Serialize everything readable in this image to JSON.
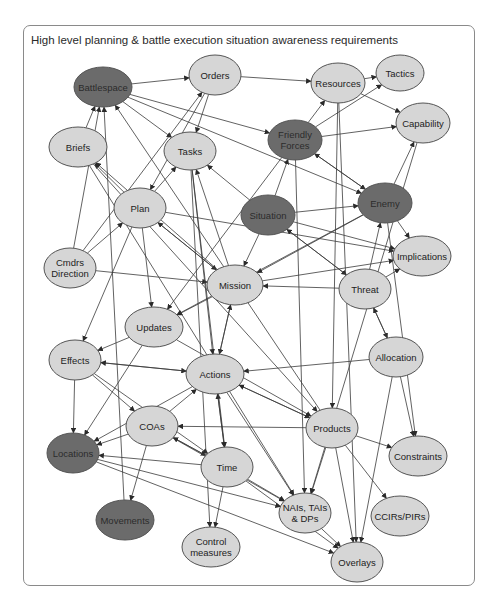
{
  "title": "High level planning & battle execution situation awareness requirements",
  "colors": {
    "light_node": "#d6d6d6",
    "dark_node": "#6b6b6b",
    "stroke": "#555555",
    "edge": "#3a3a3a"
  },
  "nodes": [
    {
      "id": "battlespace",
      "label": [
        "Battlespace"
      ],
      "x": 103,
      "y": 87,
      "rx": 29,
      "ry": 20,
      "dark": true
    },
    {
      "id": "orders",
      "label": [
        "Orders"
      ],
      "x": 215,
      "y": 75,
      "rx": 26,
      "ry": 20,
      "dark": false
    },
    {
      "id": "resources",
      "label": [
        "Resources"
      ],
      "x": 338,
      "y": 83,
      "rx": 27,
      "ry": 20,
      "dark": false
    },
    {
      "id": "tactics",
      "label": [
        "Tactics"
      ],
      "x": 400,
      "y": 73,
      "rx": 24,
      "ry": 18,
      "dark": false
    },
    {
      "id": "capability",
      "label": [
        "Capability"
      ],
      "x": 423,
      "y": 123,
      "rx": 27,
      "ry": 20,
      "dark": false
    },
    {
      "id": "briefs",
      "label": [
        "Briefs"
      ],
      "x": 78,
      "y": 147,
      "rx": 29,
      "ry": 20,
      "dark": false
    },
    {
      "id": "tasks",
      "label": [
        "Tasks"
      ],
      "x": 190,
      "y": 151,
      "rx": 26,
      "ry": 19,
      "dark": false
    },
    {
      "id": "friendly-forces",
      "label": [
        "Friendly",
        "Forces"
      ],
      "x": 295,
      "y": 140,
      "rx": 27,
      "ry": 20,
      "dark": true
    },
    {
      "id": "enemy",
      "label": [
        "Enemy"
      ],
      "x": 385,
      "y": 203,
      "rx": 27,
      "ry": 20,
      "dark": true
    },
    {
      "id": "situation",
      "label": [
        "Situation"
      ],
      "x": 268,
      "y": 215,
      "rx": 27,
      "ry": 20,
      "dark": true
    },
    {
      "id": "plan",
      "label": [
        "Plan"
      ],
      "x": 140,
      "y": 208,
      "rx": 26,
      "ry": 20,
      "dark": false
    },
    {
      "id": "cmdrs-direction",
      "label": [
        "Cmdrs",
        "Direction"
      ],
      "x": 70,
      "y": 268,
      "rx": 26,
      "ry": 20,
      "dark": false
    },
    {
      "id": "implications",
      "label": [
        "Implications"
      ],
      "x": 422,
      "y": 256,
      "rx": 29,
      "ry": 20,
      "dark": false
    },
    {
      "id": "mission",
      "label": [
        "Mission"
      ],
      "x": 235,
      "y": 285,
      "rx": 28,
      "ry": 20,
      "dark": false
    },
    {
      "id": "threat",
      "label": [
        "Threat"
      ],
      "x": 365,
      "y": 289,
      "rx": 26,
      "ry": 20,
      "dark": false
    },
    {
      "id": "updates",
      "label": [
        "Updates"
      ],
      "x": 154,
      "y": 327,
      "rx": 29,
      "ry": 20,
      "dark": false
    },
    {
      "id": "allocation",
      "label": [
        "Allocation"
      ],
      "x": 396,
      "y": 357,
      "rx": 27,
      "ry": 20,
      "dark": false
    },
    {
      "id": "effects",
      "label": [
        "Effects"
      ],
      "x": 75,
      "y": 360,
      "rx": 26,
      "ry": 20,
      "dark": false
    },
    {
      "id": "actions",
      "label": [
        "Actions"
      ],
      "x": 215,
      "y": 374,
      "rx": 29,
      "ry": 20,
      "dark": false
    },
    {
      "id": "coas",
      "label": [
        "COAs"
      ],
      "x": 152,
      "y": 426,
      "rx": 26,
      "ry": 20,
      "dark": false
    },
    {
      "id": "products",
      "label": [
        "Products"
      ],
      "x": 332,
      "y": 428,
      "rx": 26,
      "ry": 20,
      "dark": false
    },
    {
      "id": "constraints",
      "label": [
        "Constraints"
      ],
      "x": 418,
      "y": 456,
      "rx": 29,
      "ry": 20,
      "dark": false
    },
    {
      "id": "locations",
      "label": [
        "Locations"
      ],
      "x": 73,
      "y": 453,
      "rx": 26,
      "ry": 20,
      "dark": true
    },
    {
      "id": "time",
      "label": [
        "Time"
      ],
      "x": 227,
      "y": 467,
      "rx": 26,
      "ry": 20,
      "dark": false
    },
    {
      "id": "nais",
      "label": [
        "NAIs, TAIs",
        "& DPs"
      ],
      "x": 305,
      "y": 513,
      "rx": 26,
      "ry": 20,
      "dark": false
    },
    {
      "id": "ccirs",
      "label": [
        "CCIRs/PIRs"
      ],
      "x": 400,
      "y": 516,
      "rx": 29,
      "ry": 20,
      "dark": false
    },
    {
      "id": "movements",
      "label": [
        "Movements"
      ],
      "x": 125,
      "y": 520,
      "rx": 29,
      "ry": 20,
      "dark": true
    },
    {
      "id": "control-measures",
      "label": [
        "Control",
        "measures"
      ],
      "x": 211,
      "y": 547,
      "rx": 29,
      "ry": 20,
      "dark": false
    },
    {
      "id": "overlays",
      "label": [
        "Overlays"
      ],
      "x": 357,
      "y": 562,
      "rx": 26,
      "ry": 20,
      "dark": false
    }
  ],
  "edges": [
    [
      "battlespace",
      "friendly-forces"
    ],
    [
      "battlespace",
      "tasks"
    ],
    [
      "battlespace",
      "enemy"
    ],
    [
      "battlespace",
      "orders"
    ],
    [
      "orders",
      "resources"
    ],
    [
      "orders",
      "tasks"
    ],
    [
      "orders",
      "plan"
    ],
    [
      "resources",
      "tactics"
    ],
    [
      "resources",
      "capability"
    ],
    [
      "friendly-forces",
      "resources"
    ],
    [
      "friendly-forces",
      "tactics"
    ],
    [
      "friendly-forces",
      "capability"
    ],
    [
      "friendly-forces",
      "enemy"
    ],
    [
      "enemy",
      "friendly-forces"
    ],
    [
      "enemy",
      "capability"
    ],
    [
      "enemy",
      "implications"
    ],
    [
      "enemy",
      "mission"
    ],
    [
      "enemy",
      "updates"
    ],
    [
      "situation",
      "friendly-forces"
    ],
    [
      "situation",
      "enemy"
    ],
    [
      "situation",
      "implications"
    ],
    [
      "situation",
      "mission"
    ],
    [
      "situation",
      "threat"
    ],
    [
      "situation",
      "tasks"
    ],
    [
      "plan",
      "briefs"
    ],
    [
      "plan",
      "tasks"
    ],
    [
      "plan",
      "mission"
    ],
    [
      "plan",
      "updates"
    ],
    [
      "plan",
      "effects"
    ],
    [
      "plan",
      "implications"
    ],
    [
      "cmdrs-direction",
      "battlespace"
    ],
    [
      "cmdrs-direction",
      "plan"
    ],
    [
      "cmdrs-direction",
      "mission"
    ],
    [
      "cmdrs-direction",
      "orders"
    ],
    [
      "mission",
      "plan"
    ],
    [
      "mission",
      "briefs"
    ],
    [
      "mission",
      "tasks"
    ],
    [
      "mission",
      "updates"
    ],
    [
      "mission",
      "implications"
    ],
    [
      "mission",
      "actions"
    ],
    [
      "threat",
      "mission"
    ],
    [
      "threat",
      "allocation"
    ],
    [
      "threat",
      "implications"
    ],
    [
      "threat",
      "enemy"
    ],
    [
      "threat",
      "situation"
    ],
    [
      "updates",
      "effects"
    ],
    [
      "updates",
      "locations"
    ],
    [
      "updates",
      "products"
    ],
    [
      "allocation",
      "actions"
    ],
    [
      "allocation",
      "threat"
    ],
    [
      "allocation",
      "constraints"
    ],
    [
      "allocation",
      "overlays"
    ],
    [
      "effects",
      "actions"
    ],
    [
      "effects",
      "coas"
    ],
    [
      "effects",
      "locations"
    ],
    [
      "effects",
      "time"
    ],
    [
      "actions",
      "effects"
    ],
    [
      "actions",
      "time"
    ],
    [
      "actions",
      "mission"
    ],
    [
      "actions",
      "products"
    ],
    [
      "actions",
      "nais"
    ],
    [
      "actions",
      "locations"
    ],
    [
      "coas",
      "locations"
    ],
    [
      "coas",
      "movements"
    ],
    [
      "coas",
      "time"
    ],
    [
      "coas",
      "nais"
    ],
    [
      "coas",
      "actions"
    ],
    [
      "products",
      "actions"
    ],
    [
      "products",
      "coas"
    ],
    [
      "products",
      "constraints"
    ],
    [
      "products",
      "ccirs"
    ],
    [
      "products",
      "overlays"
    ],
    [
      "products",
      "nais"
    ],
    [
      "products",
      "battlespace"
    ],
    [
      "time",
      "locations"
    ],
    [
      "time",
      "control-measures"
    ],
    [
      "time",
      "nais"
    ],
    [
      "time",
      "overlays"
    ],
    [
      "time",
      "actions"
    ],
    [
      "time",
      "coas"
    ],
    [
      "locations",
      "overlays"
    ],
    [
      "locations",
      "nais"
    ],
    [
      "movements",
      "battlespace"
    ],
    [
      "nais",
      "overlays"
    ],
    [
      "tasks",
      "control-measures"
    ],
    [
      "tasks",
      "time"
    ],
    [
      "tasks",
      "actions"
    ],
    [
      "briefs",
      "battlespace"
    ],
    [
      "briefs",
      "products"
    ],
    [
      "briefs",
      "nais"
    ],
    [
      "capability",
      "nais"
    ],
    [
      "resources",
      "overlays"
    ],
    [
      "resources",
      "products"
    ],
    [
      "friendly-forces",
      "nais"
    ],
    [
      "friendly-forces",
      "updates"
    ],
    [
      "enemy",
      "constraints"
    ]
  ]
}
